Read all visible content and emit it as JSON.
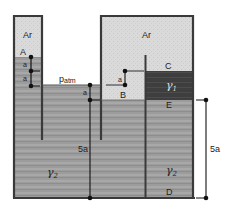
{
  "diagram": {
    "labels": {
      "air_left": "Ar",
      "air_right": "Ar",
      "point_a": "A",
      "point_b": "B",
      "point_c": "C",
      "point_d": "D",
      "point_e": "E",
      "p_atm_main": "p",
      "p_atm_sub": "atm",
      "gamma1": "γ",
      "gamma1_sub": "1",
      "gamma2_left": "γ",
      "gamma2_left_sub": "2",
      "gamma2_right": "γ",
      "gamma2_right_sub": "2"
    },
    "dimensions": {
      "left_tube_a1": "a",
      "left_tube_a2": "a",
      "patm_a": "a",
      "right_tank_a": "a",
      "center_5a": "5a",
      "right_5a": "5a"
    },
    "colors": {
      "wall": "#3a3a3a",
      "air": "#d8d8d8",
      "gamma2": "#9a9a9a",
      "gamma1": "#3c3c3c",
      "dim": "#111111"
    }
  }
}
